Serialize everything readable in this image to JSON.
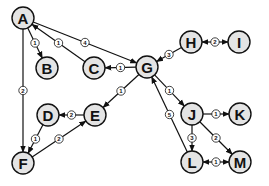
{
  "diagram": {
    "type": "weighted-directed-graph",
    "colors": {
      "node_fill": "#e4e4e4",
      "stroke": "#111111",
      "background": "#ffffff"
    },
    "nodes": [
      {
        "id": "A",
        "label": "A",
        "x": 23,
        "y": 18
      },
      {
        "id": "B",
        "label": "B",
        "x": 47,
        "y": 68
      },
      {
        "id": "C",
        "label": "C",
        "x": 94,
        "y": 68
      },
      {
        "id": "G",
        "label": "G",
        "x": 147,
        "y": 67
      },
      {
        "id": "H",
        "label": "H",
        "x": 191,
        "y": 42
      },
      {
        "id": "I",
        "label": "I",
        "x": 239,
        "y": 42
      },
      {
        "id": "D",
        "label": "D",
        "x": 48,
        "y": 115
      },
      {
        "id": "E",
        "label": "E",
        "x": 95,
        "y": 115
      },
      {
        "id": "F",
        "label": "F",
        "x": 23,
        "y": 163
      },
      {
        "id": "J",
        "label": "J",
        "x": 192,
        "y": 114
      },
      {
        "id": "K",
        "label": "K",
        "x": 240,
        "y": 114
      },
      {
        "id": "L",
        "label": "L",
        "x": 192,
        "y": 162
      },
      {
        "id": "M",
        "label": "M",
        "x": 240,
        "y": 162
      }
    ],
    "edges": [
      {
        "from": "A",
        "to": "B",
        "weight": "1",
        "bidirectional": false
      },
      {
        "from": "C",
        "to": "A",
        "weight": "1",
        "bidirectional": false
      },
      {
        "from": "A",
        "to": "G",
        "weight": "4",
        "bidirectional": false
      },
      {
        "from": "G",
        "to": "C",
        "weight": "1",
        "bidirectional": false
      },
      {
        "from": "A",
        "to": "F",
        "weight": "2",
        "bidirectional": false
      },
      {
        "from": "H",
        "to": "G",
        "weight": "3",
        "bidirectional": false
      },
      {
        "from": "H",
        "to": "I",
        "weight": "2",
        "bidirectional": true
      },
      {
        "from": "G",
        "to": "E",
        "weight": "1",
        "bidirectional": false
      },
      {
        "from": "E",
        "to": "D",
        "weight": "2",
        "bidirectional": false
      },
      {
        "from": "D",
        "to": "F",
        "weight": "1",
        "bidirectional": false
      },
      {
        "from": "F",
        "to": "E",
        "weight": "2",
        "bidirectional": false
      },
      {
        "from": "G",
        "to": "J",
        "weight": "1",
        "bidirectional": false
      },
      {
        "from": "L",
        "to": "G",
        "weight": "5",
        "bidirectional": false
      },
      {
        "from": "J",
        "to": "K",
        "weight": "1",
        "bidirectional": false
      },
      {
        "from": "J",
        "to": "L",
        "weight": "3",
        "bidirectional": false
      },
      {
        "from": "J",
        "to": "M",
        "weight": "2",
        "bidirectional": false
      },
      {
        "from": "L",
        "to": "M",
        "weight": "1",
        "bidirectional": true
      }
    ]
  }
}
